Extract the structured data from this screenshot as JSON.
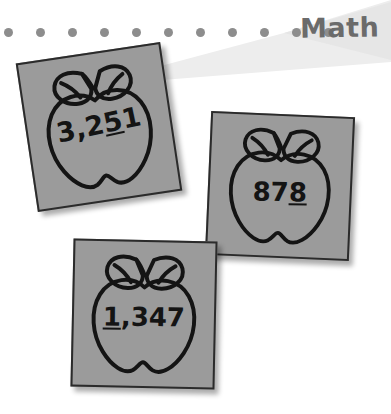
{
  "header": {
    "title": "Math",
    "banner_color": "#ededed",
    "dot_color": "#8d8d8d",
    "dot_count": 11,
    "title_color": "#6b6b6b"
  },
  "worksheet": {
    "card_background": "#9b9b9b",
    "outline_color": "#141414",
    "cards": [
      {
        "id": "apple-card-1",
        "icon": "apple-outline-icon",
        "number_prefix": "3,2",
        "number_underlined": "5",
        "number_suffix": "1",
        "number_full": "3,251"
      },
      {
        "id": "apple-card-2",
        "icon": "apple-outline-icon",
        "number_prefix": "87",
        "number_underlined": "8",
        "number_suffix": "",
        "number_full": "878"
      },
      {
        "id": "apple-card-3",
        "icon": "apple-outline-icon",
        "number_prefix": "",
        "number_underlined": "1",
        "number_suffix": ",347",
        "number_full": "1,347"
      }
    ]
  }
}
